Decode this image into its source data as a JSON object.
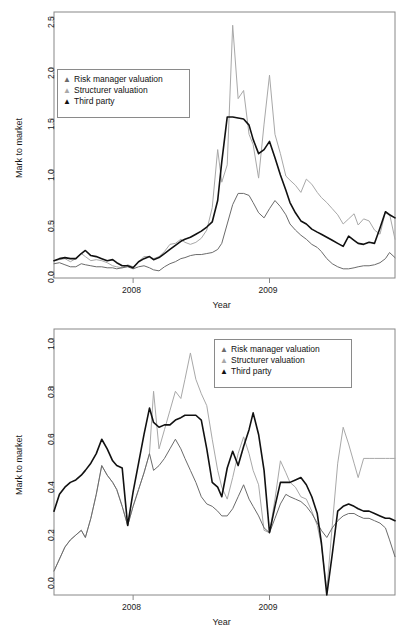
{
  "figure": {
    "panel_count": 2,
    "background": "#ffffff",
    "frame_color": "#888888"
  },
  "series_style": {
    "risk_manager": {
      "name": "Risk manager valuation",
      "color": "#6b6b6b",
      "width": 1.0,
      "marker": "▲"
    },
    "structurer": {
      "name": "Structurer valuation",
      "color": "#a8a8a8",
      "width": 1.0,
      "marker": "▲"
    },
    "third_party": {
      "name": "Third party",
      "color": "#111111",
      "width": 1.6,
      "marker": "▲"
    }
  },
  "chart_data": [
    {
      "id": "top-chart",
      "type": "line",
      "title": "",
      "xlabel": "Year",
      "ylabel": "Mark to market",
      "xlim": [
        2007.42,
        2009.92
      ],
      "ylim": [
        -0.06,
        2.55
      ],
      "yticks": [
        0.0,
        0.5,
        1.0,
        1.5,
        2.0,
        2.5
      ],
      "ytick_labels": [
        "0.0",
        "0.5",
        "1.0",
        "1.5",
        "2.0",
        "2.5"
      ],
      "xticks": [
        2008,
        2009
      ],
      "xtick_labels": [
        "2008",
        "2009"
      ],
      "grid": false,
      "legend_position": "upper-left",
      "legend_entries": [
        "Risk manager valuation",
        "Structurer valuation",
        "Third party"
      ],
      "x": [
        2007.42,
        2007.46,
        2007.5,
        2007.54,
        2007.58,
        2007.62,
        2007.65,
        2007.69,
        2007.73,
        2007.77,
        2007.81,
        2007.85,
        2007.88,
        2007.92,
        2007.96,
        2008.0,
        2008.04,
        2008.08,
        2008.12,
        2008.15,
        2008.19,
        2008.23,
        2008.27,
        2008.31,
        2008.35,
        2008.38,
        2008.42,
        2008.46,
        2008.5,
        2008.54,
        2008.58,
        2008.62,
        2008.65,
        2008.69,
        2008.73,
        2008.77,
        2008.81,
        2008.85,
        2008.88,
        2008.92,
        2008.96,
        2009.0,
        2009.04,
        2009.08,
        2009.12,
        2009.15,
        2009.19,
        2009.23,
        2009.27,
        2009.31,
        2009.35,
        2009.38,
        2009.42,
        2009.46,
        2009.5,
        2009.54,
        2009.58,
        2009.62,
        2009.65,
        2009.69,
        2009.73,
        2009.77,
        2009.81,
        2009.85,
        2009.88,
        2009.92
      ],
      "series": [
        {
          "name": "Risk manager valuation",
          "color": "#6b6b6b",
          "values": [
            0.08,
            0.09,
            0.07,
            0.05,
            0.05,
            0.08,
            0.07,
            0.06,
            0.05,
            0.05,
            0.04,
            0.04,
            0.03,
            0.04,
            0.05,
            0.03,
            0.05,
            0.06,
            0.04,
            0.02,
            0.01,
            0.05,
            0.08,
            0.1,
            0.13,
            0.14,
            0.16,
            0.17,
            0.17,
            0.18,
            0.19,
            0.22,
            0.28,
            0.47,
            0.66,
            0.77,
            0.77,
            0.75,
            0.68,
            0.58,
            0.53,
            0.62,
            0.7,
            0.64,
            0.56,
            0.47,
            0.41,
            0.36,
            0.32,
            0.27,
            0.24,
            0.2,
            0.13,
            0.08,
            0.05,
            0.03,
            0.03,
            0.04,
            0.05,
            0.06,
            0.06,
            0.07,
            0.09,
            0.13,
            0.19,
            0.14
          ]
        },
        {
          "name": "Structurer valuation",
          "color": "#a8a8a8",
          "values": [
            0.11,
            0.12,
            0.13,
            0.1,
            0.13,
            0.18,
            0.15,
            0.11,
            0.12,
            0.11,
            0.09,
            0.06,
            0.05,
            0.04,
            0.07,
            0.05,
            0.1,
            0.15,
            0.15,
            0.13,
            0.15,
            0.2,
            0.27,
            0.28,
            0.32,
            0.29,
            0.27,
            0.29,
            0.33,
            0.41,
            0.63,
            1.2,
            0.88,
            1.05,
            2.42,
            1.7,
            1.78,
            1.35,
            1.25,
            0.92,
            1.45,
            1.93,
            1.35,
            1.16,
            0.94,
            0.9,
            0.85,
            0.78,
            0.91,
            0.86,
            0.78,
            0.73,
            0.68,
            0.62,
            0.56,
            0.47,
            0.52,
            0.57,
            0.46,
            0.52,
            0.5,
            0.41,
            0.37,
            0.59,
            0.57,
            0.32
          ]
        },
        {
          "name": "Third party",
          "color": "#111111",
          "values": [
            0.11,
            0.13,
            0.14,
            0.13,
            0.13,
            0.18,
            0.21,
            0.16,
            0.15,
            0.13,
            0.11,
            0.12,
            0.09,
            0.06,
            0.06,
            0.04,
            0.1,
            0.13,
            0.15,
            0.12,
            0.14,
            0.18,
            0.22,
            0.26,
            0.3,
            0.32,
            0.34,
            0.37,
            0.4,
            0.44,
            0.49,
            0.7,
            1.08,
            1.52,
            1.52,
            1.51,
            1.5,
            1.44,
            1.3,
            1.16,
            1.2,
            1.28,
            1.12,
            0.95,
            0.8,
            0.68,
            0.58,
            0.5,
            0.47,
            0.42,
            0.39,
            0.37,
            0.34,
            0.31,
            0.28,
            0.25,
            0.35,
            0.31,
            0.28,
            0.27,
            0.29,
            0.28,
            0.43,
            0.59,
            0.56,
            0.53
          ]
        }
      ]
    },
    {
      "id": "bottom-chart",
      "type": "line",
      "title": "",
      "xlabel": "Year",
      "ylabel": "Mark to market",
      "xlim": [
        2007.42,
        2009.92
      ],
      "ylim": [
        -0.07,
        1.04
      ],
      "yticks": [
        0.0,
        0.2,
        0.4,
        0.6,
        0.8,
        1.0
      ],
      "ytick_labels": [
        "0.0",
        "0.2",
        "0.4",
        "0.6",
        "0.8",
        "1.0"
      ],
      "xticks": [
        2008,
        2009
      ],
      "xtick_labels": [
        "2008",
        "2009"
      ],
      "grid": false,
      "legend_position": "upper-right",
      "legend_entries": [
        "Risk manager valuation",
        "Structurer valuation",
        "Third party"
      ],
      "x": [
        2007.42,
        2007.46,
        2007.5,
        2007.54,
        2007.58,
        2007.62,
        2007.65,
        2007.69,
        2007.73,
        2007.77,
        2007.81,
        2007.85,
        2007.88,
        2007.92,
        2007.96,
        2008.0,
        2008.04,
        2008.08,
        2008.12,
        2008.15,
        2008.19,
        2008.23,
        2008.27,
        2008.31,
        2008.35,
        2008.38,
        2008.42,
        2008.46,
        2008.5,
        2008.54,
        2008.58,
        2008.62,
        2008.65,
        2008.69,
        2008.73,
        2008.77,
        2008.81,
        2008.85,
        2008.88,
        2008.92,
        2008.96,
        2009.0,
        2009.04,
        2009.08,
        2009.12,
        2009.15,
        2009.19,
        2009.23,
        2009.27,
        2009.31,
        2009.35,
        2009.38,
        2009.42,
        2009.46,
        2009.5,
        2009.54,
        2009.58,
        2009.62,
        2009.65,
        2009.69,
        2009.73,
        2009.77,
        2009.81,
        2009.85,
        2009.88,
        2009.92
      ],
      "series": [
        {
          "name": "Risk manager valuation",
          "color": "#6b6b6b",
          "values": [
            0.03,
            0.08,
            0.13,
            0.16,
            0.18,
            0.2,
            0.17,
            0.25,
            0.35,
            0.47,
            0.43,
            0.4,
            0.37,
            0.3,
            0.22,
            0.3,
            0.37,
            0.44,
            0.52,
            0.45,
            0.47,
            0.5,
            0.54,
            0.58,
            0.54,
            0.5,
            0.45,
            0.4,
            0.34,
            0.31,
            0.3,
            0.28,
            0.26,
            0.26,
            0.29,
            0.34,
            0.39,
            0.33,
            0.3,
            0.26,
            0.21,
            0.19,
            0.25,
            0.31,
            0.35,
            0.34,
            0.33,
            0.32,
            0.3,
            0.27,
            0.23,
            0.2,
            0.17,
            0.21,
            0.24,
            0.26,
            0.27,
            0.27,
            0.26,
            0.25,
            0.25,
            0.24,
            0.23,
            0.21,
            0.16,
            0.09
          ]
        },
        {
          "name": "Structurer valuation",
          "color": "#a8a8a8",
          "values": [
            0.03,
            0.08,
            0.13,
            0.16,
            0.18,
            0.2,
            0.17,
            0.25,
            0.35,
            0.47,
            0.43,
            0.4,
            0.37,
            0.3,
            0.22,
            0.3,
            0.37,
            0.44,
            0.52,
            0.78,
            0.54,
            0.62,
            0.7,
            0.78,
            0.75,
            0.83,
            0.94,
            0.83,
            0.77,
            0.72,
            0.58,
            0.45,
            0.38,
            0.33,
            0.42,
            0.52,
            0.59,
            0.52,
            0.45,
            0.39,
            0.2,
            0.19,
            0.33,
            0.49,
            0.44,
            0.4,
            0.38,
            0.34,
            0.33,
            0.28,
            0.22,
            0.14,
            -0.05,
            0.22,
            0.48,
            0.63,
            0.56,
            0.48,
            0.42,
            0.5,
            0.5,
            0.5,
            0.5,
            0.5,
            0.5,
            0.5
          ]
        },
        {
          "name": "Third party",
          "color": "#111111",
          "values": [
            0.28,
            0.35,
            0.38,
            0.4,
            0.41,
            0.43,
            0.45,
            0.48,
            0.52,
            0.58,
            0.54,
            0.49,
            0.47,
            0.46,
            0.22,
            0.36,
            0.48,
            0.6,
            0.71,
            0.65,
            0.63,
            0.64,
            0.64,
            0.66,
            0.67,
            0.68,
            0.68,
            0.68,
            0.66,
            0.54,
            0.4,
            0.38,
            0.34,
            0.46,
            0.53,
            0.47,
            0.55,
            0.62,
            0.69,
            0.6,
            0.45,
            0.19,
            0.3,
            0.4,
            0.4,
            0.4,
            0.41,
            0.42,
            0.39,
            0.34,
            0.27,
            0.15,
            -0.07,
            0.1,
            0.28,
            0.3,
            0.31,
            0.3,
            0.29,
            0.28,
            0.28,
            0.27,
            0.26,
            0.25,
            0.25,
            0.24
          ]
        }
      ]
    }
  ]
}
